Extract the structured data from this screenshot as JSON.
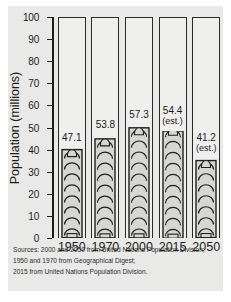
{
  "chart_data": {
    "type": "bar",
    "title": "",
    "xlabel": "",
    "ylabel": "Population (millions)",
    "ylim": [
      0,
      100
    ],
    "yticks": [
      0,
      10,
      20,
      30,
      40,
      50,
      60,
      70,
      80,
      90,
      100
    ],
    "grid": false,
    "legend": "none",
    "categories": [
      "1950",
      "1970",
      "2000",
      "2015",
      "2050"
    ],
    "values": [
      47.1,
      53.8,
      57.3,
      54.4,
      41.2
    ],
    "bar_drawn_heights": [
      41,
      47,
      51.5,
      48.5,
      36
    ],
    "data_labels": [
      "47.1",
      "53.8",
      "57.3",
      "54.4",
      "41.2"
    ],
    "annotations": [
      "",
      "",
      "",
      "(est.)",
      "(est.)"
    ],
    "notes": [
      "Sources: 2000 and 2050 from United Nations Population Division;",
      "1950 and 1970 from Geographical Digest;",
      "2015 from United Nations Population Division."
    ]
  },
  "style": {
    "background": "#e9e9e7",
    "ink": "#1b1b1b",
    "bar_fill": "#d6d6d4",
    "bar_outline": "#1f1f1f",
    "column_fill": "#efefed"
  }
}
